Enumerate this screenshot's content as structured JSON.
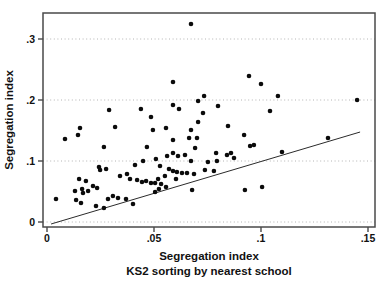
{
  "chart_data": {
    "type": "scatter",
    "title": "",
    "xlabel": "Segregation index",
    "xlabel_sub": "KS2 sorting by nearest school",
    "ylabel": "Segregation index",
    "xlim": [
      0,
      0.15
    ],
    "ylim": [
      0,
      0.3
    ],
    "grid": "horizontal dotted lines at each y tick, legend none",
    "x_ticks": [
      {
        "value": 0,
        "label": "0"
      },
      {
        "value": 0.05,
        "label": ".05"
      },
      {
        "value": 0.1,
        "label": ".1"
      },
      {
        "value": 0.15,
        "label": ".15"
      }
    ],
    "y_ticks": [
      {
        "value": 0,
        "label": "0"
      },
      {
        "value": 0.1,
        "label": ".1"
      },
      {
        "value": 0.2,
        "label": ".2"
      },
      {
        "value": 0.3,
        "label": ".3"
      }
    ],
    "ref_line": {
      "x1": 0.0019,
      "y1": -0.0033,
      "x2": 0.1463,
      "y2": 0.1475
    },
    "colors": {
      "point": "#0b0b0b",
      "grid": "#b4b4b4",
      "frame": "#4a4a4a",
      "axis": "#2b2b2b",
      "line": "#2b2b2b"
    },
    "points": [
      [
        0.0673,
        0.3246
      ],
      [
        0.0589,
        0.2295
      ],
      [
        0.0944,
        0.2393
      ],
      [
        0.1,
        0.2262
      ],
      [
        0.1079,
        0.2066
      ],
      [
        0.1449,
        0.2
      ],
      [
        0.1042,
        0.182
      ],
      [
        0.1313,
        0.1377
      ],
      [
        0.1098,
        0.1148
      ],
      [
        0.029,
        0.1836
      ],
      [
        0.0439,
        0.1852
      ],
      [
        0.0486,
        0.1721
      ],
      [
        0.0154,
        0.1541
      ],
      [
        0.0318,
        0.1557
      ],
      [
        0.0495,
        0.1508
      ],
      [
        0.0084,
        0.1361
      ],
      [
        0.0145,
        0.1426
      ],
      [
        0.0266,
        0.123
      ],
      [
        0.0467,
        0.123
      ],
      [
        0.0734,
        0.2066
      ],
      [
        0.0706,
        0.1984
      ],
      [
        0.0589,
        0.1918
      ],
      [
        0.0617,
        0.1852
      ],
      [
        0.0799,
        0.1902
      ],
      [
        0.0729,
        0.1787
      ],
      [
        0.0706,
        0.1639
      ],
      [
        0.0556,
        0.1541
      ],
      [
        0.0673,
        0.1508
      ],
      [
        0.0846,
        0.1574
      ],
      [
        0.0921,
        0.1426
      ],
      [
        0.0664,
        0.1377
      ],
      [
        0.0701,
        0.1377
      ],
      [
        0.0589,
        0.1344
      ],
      [
        0.0692,
        0.1213
      ],
      [
        0.0949,
        0.1246
      ],
      [
        0.0967,
        0.1262
      ],
      [
        0.0509,
        0.1033
      ],
      [
        0.0561,
        0.1082
      ],
      [
        0.0589,
        0.1131
      ],
      [
        0.0612,
        0.1082
      ],
      [
        0.0645,
        0.1098
      ],
      [
        0.0673,
        0.1
      ],
      [
        0.0752,
        0.0984
      ],
      [
        0.079,
        0.1131
      ],
      [
        0.0794,
        0.1
      ],
      [
        0.0841,
        0.1098
      ],
      [
        0.086,
        0.1131
      ],
      [
        0.0874,
        0.1049
      ],
      [
        0.0449,
        0.1
      ],
      [
        0.0248,
        0.0852
      ],
      [
        0.0276,
        0.0869
      ],
      [
        0.0341,
        0.0754
      ],
      [
        0.0374,
        0.0787
      ],
      [
        0.0388,
        0.0705
      ],
      [
        0.0421,
        0.0689
      ],
      [
        0.0444,
        0.0656
      ],
      [
        0.0463,
        0.0672
      ],
      [
        0.0486,
        0.0639
      ],
      [
        0.015,
        0.0705
      ],
      [
        0.0182,
        0.0672
      ],
      [
        0.0215,
        0.059
      ],
      [
        0.0234,
        0.0557
      ],
      [
        0.0164,
        0.0541
      ],
      [
        0.0192,
        0.0508
      ],
      [
        0.0042,
        0.0377
      ],
      [
        0.0136,
        0.0361
      ],
      [
        0.0159,
        0.0311
      ],
      [
        0.0229,
        0.0262
      ],
      [
        0.0266,
        0.023
      ],
      [
        0.0308,
        0.0426
      ],
      [
        0.0332,
        0.0393
      ],
      [
        0.0369,
        0.0377
      ],
      [
        0.0402,
        0.0295
      ],
      [
        0.0285,
        0.0377
      ],
      [
        0.0243,
        0.0902
      ],
      [
        0.0131,
        0.0508
      ],
      [
        0.0168,
        0.0475
      ],
      [
        0.0528,
        0.0918
      ],
      [
        0.057,
        0.0869
      ],
      [
        0.0589,
        0.0836
      ],
      [
        0.0607,
        0.082
      ],
      [
        0.0631,
        0.0803
      ],
      [
        0.0654,
        0.0803
      ],
      [
        0.0551,
        0.0754
      ],
      [
        0.0519,
        0.0705
      ],
      [
        0.0505,
        0.0639
      ],
      [
        0.0533,
        0.0623
      ],
      [
        0.0556,
        0.0574
      ],
      [
        0.0523,
        0.0541
      ],
      [
        0.0505,
        0.0492
      ],
      [
        0.0603,
        0.0705
      ],
      [
        0.0687,
        0.0787
      ],
      [
        0.0738,
        0.0852
      ],
      [
        0.078,
        0.0836
      ],
      [
        0.0678,
        0.0525
      ],
      [
        0.0925,
        0.0525
      ],
      [
        0.1005,
        0.0574
      ],
      [
        0.0411,
        0.0934
      ]
    ]
  }
}
